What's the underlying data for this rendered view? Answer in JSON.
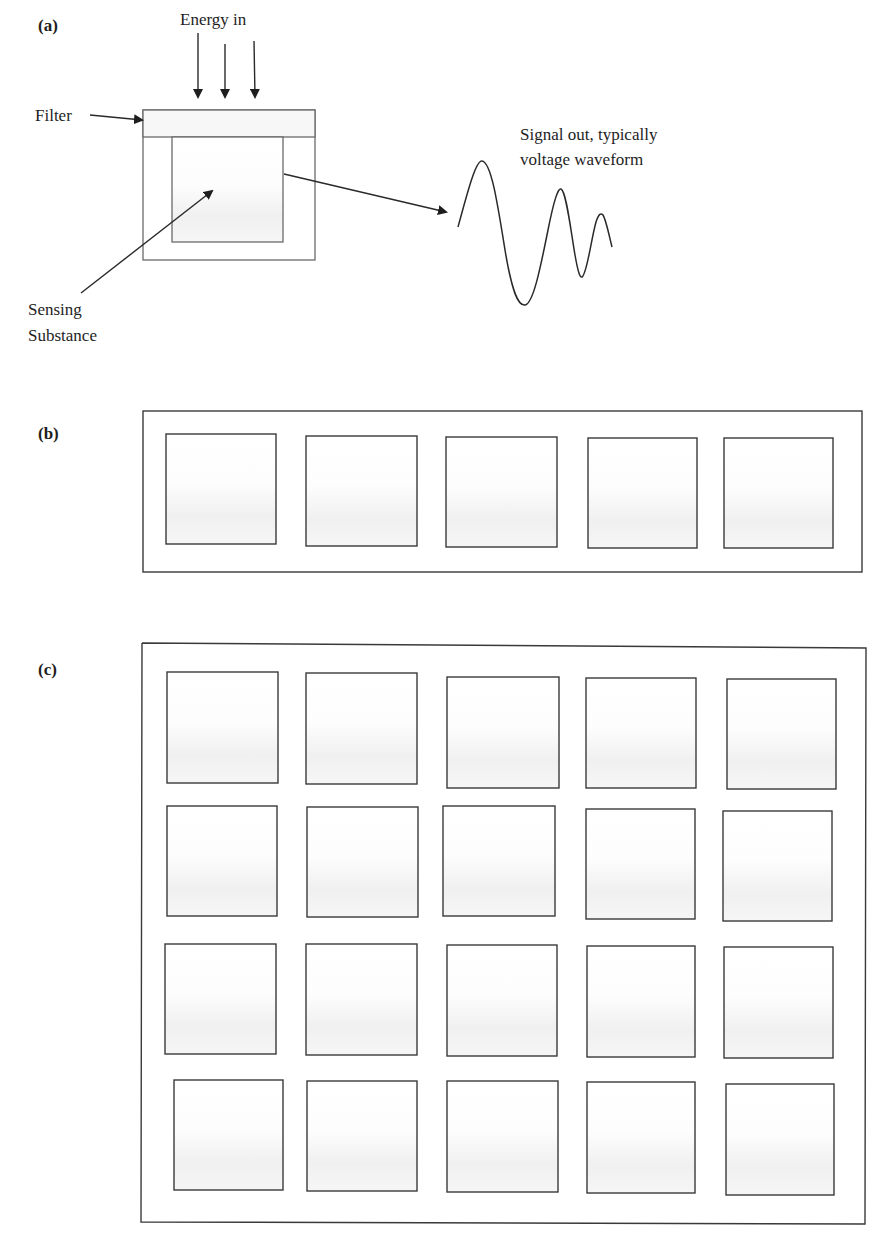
{
  "figure": {
    "panel_a": {
      "label": "(a)",
      "energy_label": "Energy in",
      "filter_label": "Filter",
      "sensing_label_line1": "Sensing",
      "sensing_label_line2": "Substance",
      "signal_label_line1": "Signal out, typically",
      "signal_label_line2": "voltage waveform",
      "energy_arrow_count": 3
    },
    "panel_b": {
      "label": "(b)",
      "description": "Linear array of sensing elements",
      "rows": 1,
      "columns": 5
    },
    "panel_c": {
      "label": "(c)",
      "description": "Two-dimensional array of sensing elements",
      "rows": 4,
      "columns": 5
    },
    "colors": {
      "line": "#3a3a3a",
      "cell_fill_top": "#ffffff",
      "cell_fill_bottom": "#f1f1f1",
      "background": "#ffffff"
    }
  }
}
